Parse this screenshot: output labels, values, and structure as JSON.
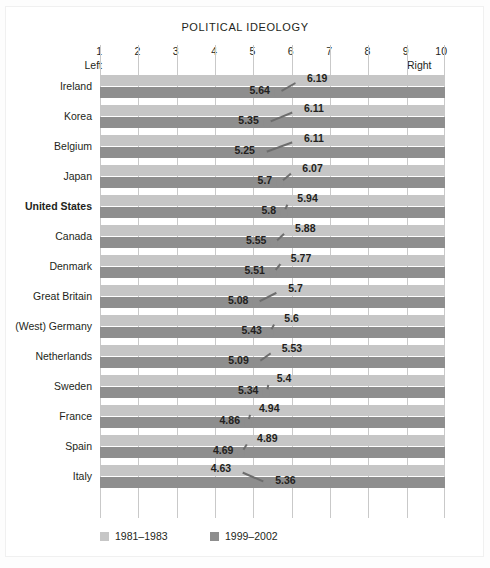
{
  "chart": {
    "title": "POLITICAL IDEOLOGY",
    "axis": {
      "ticks": [
        "1",
        "2",
        "3",
        "4",
        "5",
        "6",
        "7",
        "8",
        "9",
        "10"
      ],
      "left_label": "Left",
      "right_label": "Right",
      "min": 1,
      "max": 10
    },
    "legend": [
      {
        "label": "1981–1983",
        "color": "#c6c6c6"
      },
      {
        "label": "1999–2002",
        "color": "#8e8e8e"
      }
    ]
  },
  "chart_data": {
    "type": "scatter",
    "title": "POLITICAL IDEOLOGY",
    "xlabel": "",
    "ylabel": "",
    "xlim": [
      1,
      10
    ],
    "grid": true,
    "legend_position": "bottom-left",
    "axis_endpoint_labels": {
      "left": "Left",
      "right": "Right"
    },
    "categories": [
      "Ireland",
      "Korea",
      "Belgium",
      "Japan",
      "United States",
      "Canada",
      "Denmark",
      "Great Britain",
      "(West) Germany",
      "Netherlands",
      "Sweden",
      "France",
      "Spain",
      "Italy"
    ],
    "series": [
      {
        "name": "1981–1983",
        "color": "#c6c6c6",
        "values": [
          6.19,
          6.11,
          6.11,
          6.07,
          5.94,
          5.88,
          5.77,
          5.7,
          5.6,
          5.53,
          5.4,
          4.94,
          4.89,
          4.63
        ]
      },
      {
        "name": "1999–2002",
        "color": "#8e8e8e",
        "values": [
          5.64,
          5.35,
          5.25,
          5.7,
          5.8,
          5.55,
          5.51,
          5.08,
          5.43,
          5.09,
          5.34,
          4.86,
          4.69,
          5.36
        ]
      }
    ],
    "rows": [
      {
        "country": "Ireland",
        "old": 6.19,
        "new": 5.64,
        "highlight": false
      },
      {
        "country": "Korea",
        "old": 6.11,
        "new": 5.35,
        "highlight": false
      },
      {
        "country": "Belgium",
        "old": 6.11,
        "new": 5.25,
        "highlight": false
      },
      {
        "country": "Japan",
        "old": 6.07,
        "new": 5.7,
        "highlight": false
      },
      {
        "country": "United States",
        "old": 5.94,
        "new": 5.8,
        "highlight": true
      },
      {
        "country": "Canada",
        "old": 5.88,
        "new": 5.55,
        "highlight": false
      },
      {
        "country": "Denmark",
        "old": 5.77,
        "new": 5.51,
        "highlight": false
      },
      {
        "country": "Great Britain",
        "old": 5.7,
        "new": 5.08,
        "highlight": false
      },
      {
        "country": "(West) Germany",
        "old": 5.6,
        "new": 5.43,
        "highlight": false
      },
      {
        "country": "Netherlands",
        "old": 5.53,
        "new": 5.09,
        "highlight": false
      },
      {
        "country": "Sweden",
        "old": 5.4,
        "new": 5.34,
        "highlight": false
      },
      {
        "country": "France",
        "old": 4.94,
        "new": 4.86,
        "highlight": false
      },
      {
        "country": "Spain",
        "old": 4.89,
        "new": 4.69,
        "highlight": false
      },
      {
        "country": "Italy",
        "old": 4.63,
        "new": 5.36,
        "highlight": false
      }
    ]
  }
}
